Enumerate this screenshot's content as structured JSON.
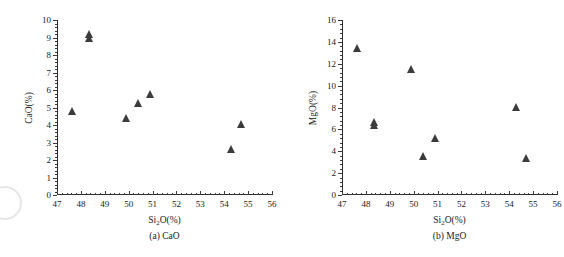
{
  "figure": {
    "background": "#ffffff",
    "marker_color": "#3b3b3b",
    "axis_color": "#2b2b2b"
  },
  "chart_data": [
    {
      "type": "scatter",
      "title": "(a) CaO",
      "caption": "(a) CaO",
      "xlabel": "Si2O(%)",
      "ylabel": "CaO(%)",
      "xlim": [
        47,
        56
      ],
      "ylim": [
        0,
        10
      ],
      "xticks": [
        47,
        48,
        49,
        50,
        51,
        52,
        53,
        54,
        55,
        56
      ],
      "yticks": [
        0,
        1,
        2,
        3,
        4,
        5,
        6,
        7,
        8,
        9,
        10
      ],
      "xtick_labels": [
        "47",
        "48",
        "49",
        "50",
        "51",
        "52",
        "53",
        "54",
        "55",
        "56"
      ],
      "ytick_labels": [
        "0",
        "1",
        "2",
        "3",
        "4",
        "5",
        "6",
        "7",
        "8",
        "9",
        "10"
      ],
      "grid": false,
      "legend": "none",
      "points": [
        {
          "x": 47.63,
          "y": 4.75
        },
        {
          "x": 48.33,
          "y": 9.15
        },
        {
          "x": 48.35,
          "y": 8.9
        },
        {
          "x": 49.9,
          "y": 4.35
        },
        {
          "x": 50.4,
          "y": 5.2
        },
        {
          "x": 50.9,
          "y": 5.7
        },
        {
          "x": 54.3,
          "y": 2.55
        },
        {
          "x": 54.7,
          "y": 4.0
        }
      ]
    },
    {
      "type": "scatter",
      "title": "(b) MgO",
      "caption": "(b) MgO",
      "xlabel": "Si2O(%)",
      "ylabel": "MgO(%)",
      "xlim": [
        47,
        56
      ],
      "ylim": [
        0,
        16
      ],
      "xticks": [
        47,
        48,
        49,
        50,
        51,
        52,
        53,
        54,
        55,
        56
      ],
      "yticks": [
        0,
        2,
        4,
        6,
        8,
        10,
        12,
        14,
        16
      ],
      "xtick_labels": [
        "47",
        "48",
        "49",
        "50",
        "51",
        "52",
        "53",
        "54",
        "55",
        "56"
      ],
      "ytick_labels": [
        "0",
        "2",
        "4",
        "6",
        "8",
        "10",
        "12",
        "14",
        "16"
      ],
      "grid": false,
      "legend": "none",
      "points": [
        {
          "x": 47.63,
          "y": 13.35
        },
        {
          "x": 48.33,
          "y": 6.6
        },
        {
          "x": 48.35,
          "y": 6.3
        },
        {
          "x": 49.9,
          "y": 11.4
        },
        {
          "x": 50.4,
          "y": 3.5
        },
        {
          "x": 50.9,
          "y": 5.1
        },
        {
          "x": 54.3,
          "y": 8.0
        },
        {
          "x": 54.7,
          "y": 3.3
        }
      ]
    }
  ]
}
